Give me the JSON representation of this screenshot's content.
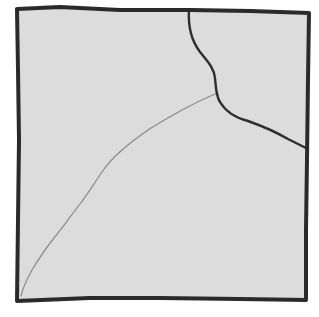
{
  "sketch": {
    "subject": "cracked-square-tile",
    "colors": {
      "background": "#ffffff",
      "fill": "#dcdcdc",
      "outline": "#2a2a2a",
      "crack_dark": "#2e2e2e",
      "crack_faint": "#8a8a8a"
    },
    "outline_points": "17,9 60,7 120,10 190,10 250,11 309,13 308,80 307,160 306,230 306,300 240,299 160,298 90,298 17,301 18,220 19,140 18,70 17,9",
    "crack_dark_path": "M189,10 C188,25 191,40 200,52 C208,62 214,68 215,78 C216,88 216,96 220,102 C226,112 236,118 248,121 C262,126 276,132 288,139 C296,143 302,146 306,148",
    "crack_faint_path": "M218,93 C205,98 195,103 182,110 C170,117 160,122 148,130 C138,137 130,143 122,150 C115,156 108,163 102,172 C95,182 88,194 80,204 C72,214 64,226 54,238 C46,248 38,260 32,270 C27,279 23,287 21,296"
  }
}
